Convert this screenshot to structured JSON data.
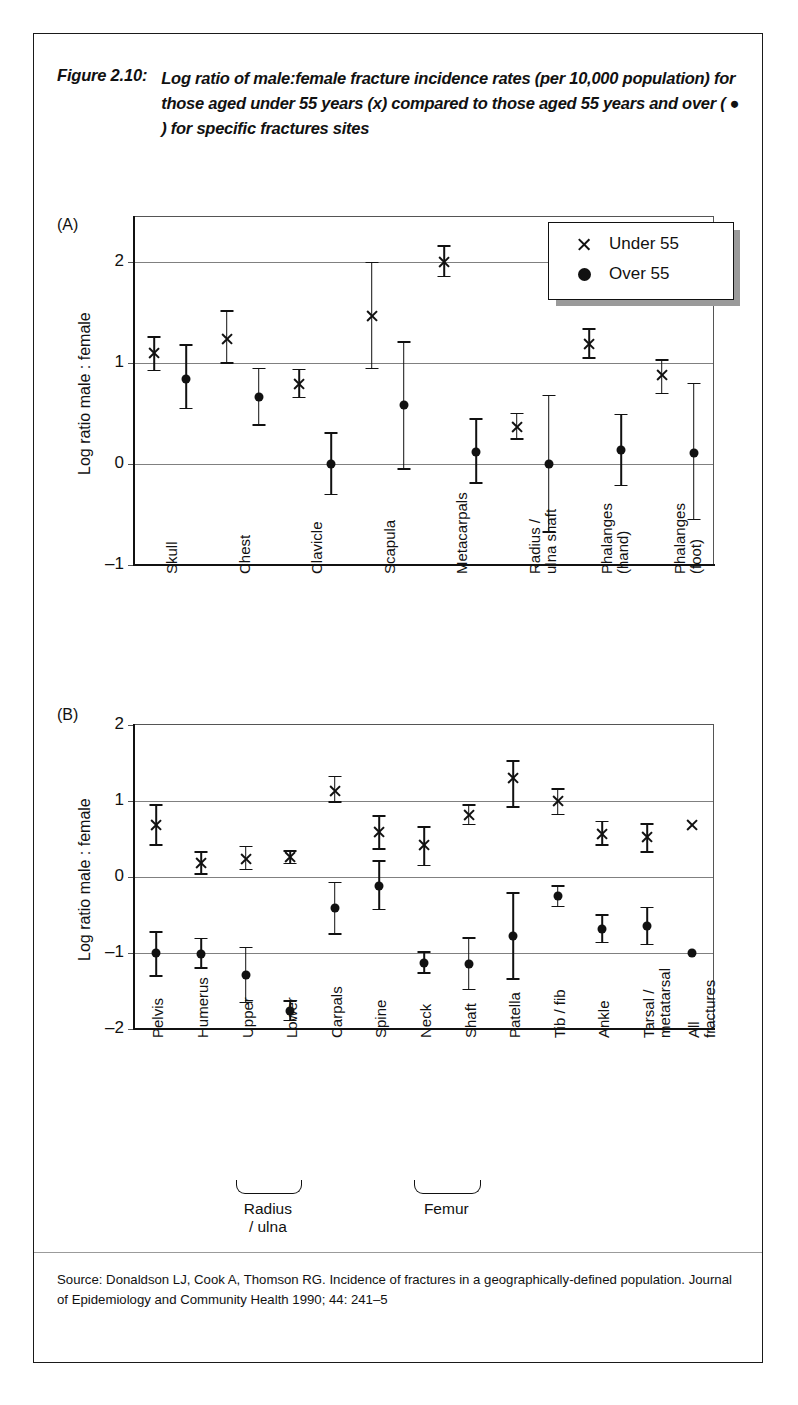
{
  "figure": {
    "number": "Figure 2.10:",
    "title": "Log ratio of male:female fracture incidence rates (per 10,000 population) for those aged under 55 years (x) compared to those aged 55 years and over ( ● ) for specific fractures sites",
    "source": "Source: Donaldson LJ, Cook A, Thomson RG. Incidence of fractures in a geographically-defined population. Journal of Epidemiology and Community Health 1990; 44: 241–5"
  },
  "legend": {
    "position": "top-right-inside",
    "items": [
      {
        "marker": "cross-icon",
        "label": "Under 55"
      },
      {
        "marker": "filled-circle-icon",
        "label": "Over 55"
      }
    ]
  },
  "chart_data": [
    {
      "type": "scatter",
      "panel": "(A)",
      "title": "",
      "xlabel": "",
      "ylabel": "Log ratio male : female",
      "ylim": [
        -1,
        2.45
      ],
      "yticks": [
        -1,
        0,
        1,
        2
      ],
      "ytick_labels": [
        "–1",
        "0",
        "1",
        "2"
      ],
      "grid": true,
      "gridlines": [
        0,
        1,
        2
      ],
      "categories": [
        "Skull",
        "Chest",
        "Clavicle",
        "Scapula",
        "Metacarpals",
        "Radius /\nulna shaft",
        "Phalanges\n(hand)",
        "Phalanges\n(foot)"
      ],
      "series": [
        {
          "name": "Under 55",
          "marker": "cross",
          "values": [
            1.1,
            1.24,
            0.79,
            1.47,
            2.0,
            0.37,
            1.19,
            0.88
          ],
          "ci_low": [
            0.93,
            1.0,
            0.66,
            0.95,
            1.86,
            0.25,
            1.05,
            0.7
          ],
          "ci_high": [
            1.26,
            1.52,
            0.94,
            2.0,
            2.16,
            0.5,
            1.34,
            1.03
          ]
        },
        {
          "name": "Over 55",
          "marker": "circle",
          "values": [
            0.84,
            0.67,
            0.0,
            0.59,
            0.12,
            0.0,
            0.14,
            0.11
          ],
          "ci_low": [
            0.55,
            0.39,
            -0.3,
            -0.05,
            -0.19,
            -0.67,
            -0.21,
            -0.55
          ],
          "ci_high": [
            1.18,
            0.95,
            0.31,
            1.21,
            0.45,
            0.68,
            0.49,
            0.8
          ]
        }
      ]
    },
    {
      "type": "scatter",
      "panel": "(B)",
      "title": "",
      "xlabel": "",
      "ylabel": "Log ratio male : female",
      "ylim": [
        -2,
        2
      ],
      "yticks": [
        -2,
        -1,
        0,
        1,
        2
      ],
      "ytick_labels": [
        "–2",
        "–1",
        "0",
        "1",
        "2"
      ],
      "grid": true,
      "gridlines": [
        -1,
        0,
        1
      ],
      "categories": [
        "Pelvis",
        "Humerus",
        "Upper",
        "Lower",
        "Carpals",
        "Spine",
        "Neck",
        "Shaft",
        "Patella",
        "Tib / fib",
        "Ankle",
        "Tarsal /\nmetatarsal",
        "All\nfractures"
      ],
      "group_braces": [
        {
          "label": "Radius / ulna",
          "from": "Upper",
          "to": "Lower"
        },
        {
          "label": "Femur",
          "from": "Neck",
          "to": "Shaft"
        }
      ],
      "series": [
        {
          "name": "Under 55",
          "marker": "cross",
          "values": [
            0.68,
            0.18,
            0.24,
            0.26,
            1.13,
            0.59,
            0.42,
            0.82,
            1.3,
            1.0,
            0.57,
            0.52,
            0.68
          ],
          "ci_low": [
            0.42,
            0.04,
            0.1,
            0.18,
            0.99,
            0.37,
            0.15,
            0.69,
            0.92,
            0.82,
            0.42,
            0.33,
            null
          ],
          "ci_high": [
            0.95,
            0.33,
            0.4,
            0.34,
            1.32,
            0.8,
            0.66,
            0.95,
            1.53,
            1.16,
            0.73,
            0.7,
            null
          ]
        },
        {
          "name": "Over 55",
          "marker": "circle",
          "values": [
            -1.0,
            -1.01,
            -1.29,
            -1.76,
            -0.41,
            -0.12,
            -1.13,
            -1.14,
            -0.78,
            -0.25,
            -0.68,
            -0.64,
            -1.0
          ],
          "ci_low": [
            -1.3,
            -1.2,
            -1.65,
            -1.89,
            -0.75,
            -0.43,
            -1.26,
            -1.48,
            -1.34,
            -0.39,
            -0.86,
            -0.89,
            null
          ],
          "ci_high": [
            -0.72,
            -0.81,
            -0.93,
            -1.63,
            -0.07,
            0.21,
            -0.99,
            -0.8,
            -0.21,
            -0.12,
            -0.5,
            -0.4,
            null
          ]
        }
      ]
    }
  ]
}
